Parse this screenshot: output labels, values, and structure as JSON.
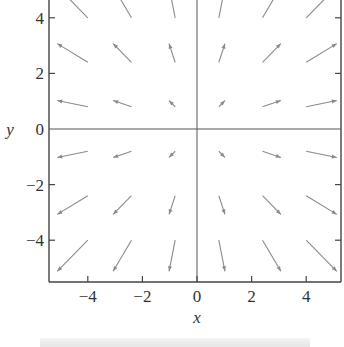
{
  "chart_data": {
    "type": "vector_field",
    "title": "",
    "xlabel": "x",
    "ylabel": "y",
    "xlim": [
      -5.6,
      5.6
    ],
    "ylim": [
      -5.6,
      4.7
    ],
    "xticks": [
      -4,
      -2,
      0,
      2,
      4
    ],
    "yticks": [
      4,
      2,
      0,
      -2,
      -4
    ],
    "xtick_labels": [
      "−4",
      "−2",
      "0",
      "2",
      "4"
    ],
    "ytick_labels": [
      "4",
      "2",
      "0",
      "−2",
      "−4"
    ],
    "grid": false,
    "field": "F(x, y) = (x, y) radial outward",
    "arrow_tail_x": [
      -4,
      -2.4,
      -0.8,
      0.8,
      2.4,
      4
    ],
    "arrow_tail_y": [
      4,
      2.4,
      0.8,
      -0.8,
      -2.4,
      -4
    ],
    "arrow_scale": 0.28,
    "arrow_color": "#8a8a8a",
    "axis_color": "#444444"
  }
}
